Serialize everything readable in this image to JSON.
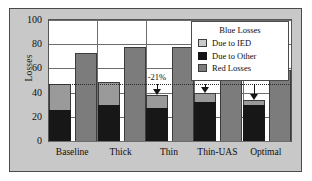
{
  "chart_data": {
    "type": "bar",
    "title": "",
    "xlabel": "",
    "ylabel": "Losses",
    "ylim": [
      0,
      100
    ],
    "yticks": [
      0,
      20,
      40,
      60,
      80,
      100
    ],
    "grid": true,
    "legend_position": "top-right",
    "legend_title": "Blue Losses",
    "categories": [
      "Baseline",
      "Thick",
      "Thin",
      "Thin-UAS",
      "Optimal"
    ],
    "series": [
      {
        "name": "Due to Other",
        "stack": "blue",
        "values": [
          26,
          30,
          27,
          32,
          30
        ],
        "color": "#171717"
      },
      {
        "name": "Due to IED",
        "stack": "blue",
        "values": [
          21,
          19,
          11,
          8,
          4
        ],
        "color": "#9a9a9a"
      },
      {
        "name": "Red Losses",
        "stack": "red",
        "values": [
          73,
          78,
          78,
          59,
          59
        ],
        "color": "#7c7c7c"
      }
    ],
    "blue_totals": [
      47,
      49,
      38,
      40,
      34
    ],
    "reference_line_value": 47,
    "annotations": [
      {
        "category": "Thin",
        "text": "-21%",
        "points_to": 38
      },
      {
        "category": "Thin-UAS",
        "text": "-17%",
        "points_to": 40
      },
      {
        "category": "Optimal",
        "text": "-27%",
        "points_to": 34
      }
    ]
  },
  "axis": {
    "y_label": "Losses",
    "y_ticks": [
      "0",
      "20",
      "40",
      "60",
      "80",
      "100"
    ],
    "x_ticks": [
      "Baseline",
      "Thick",
      "Thin",
      "Thin-UAS",
      "Optimal"
    ]
  },
  "legend": {
    "title": "Blue Losses",
    "entries": [
      {
        "label": "Due to IED",
        "swatch": "ied-swatch"
      },
      {
        "label": "Due to Other",
        "swatch": "other-swatch"
      },
      {
        "label": "Red Losses",
        "swatch": "red-swatch"
      }
    ]
  },
  "annotations": {
    "thin": "-21%",
    "thin_uas": "-17%",
    "optimal": "-27%"
  }
}
